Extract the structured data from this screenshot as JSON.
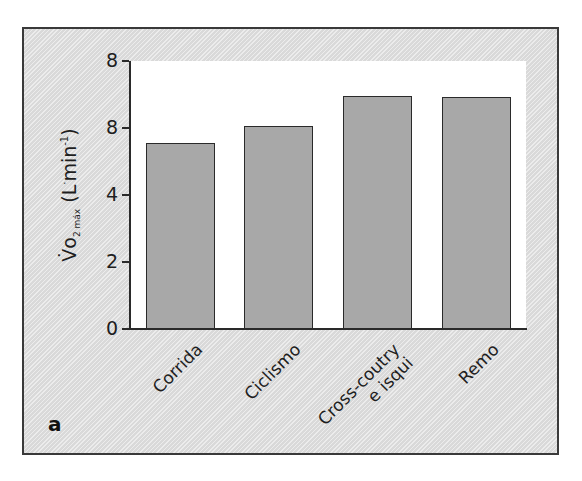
{
  "chart_data": {
    "type": "bar",
    "title": "",
    "panel_label": "a",
    "xlabel": "",
    "ylabel": {
      "main": "V̇o",
      "sub": "2 máx",
      "unit": "(L",
      "sup": "·",
      "unit_rest": "min",
      "unit_sup": "-1",
      "unit_close": ")"
    },
    "ylabel_text": "V̇O2 máx (L·min⁻¹)",
    "ylim": [
      0,
      8
    ],
    "yticks": [
      {
        "value": 0,
        "label": "0"
      },
      {
        "value": 2,
        "label": "2"
      },
      {
        "value": 4,
        "label": "4"
      },
      {
        "value": 6,
        "label": "8"
      },
      {
        "value": 8,
        "label": "8"
      }
    ],
    "categories": [
      "Corrida",
      "Ciclismo",
      "Cross-coutry e isqui",
      "Remo"
    ],
    "category_lines": [
      [
        "Corrida"
      ],
      [
        "Ciclismo"
      ],
      [
        "Cross-coutry",
        "e isqui"
      ],
      [
        "Remo"
      ]
    ],
    "values": [
      5.55,
      6.05,
      6.95,
      6.93
    ],
    "bar_color": "#a8a8a8",
    "grid": false,
    "legend": null
  }
}
